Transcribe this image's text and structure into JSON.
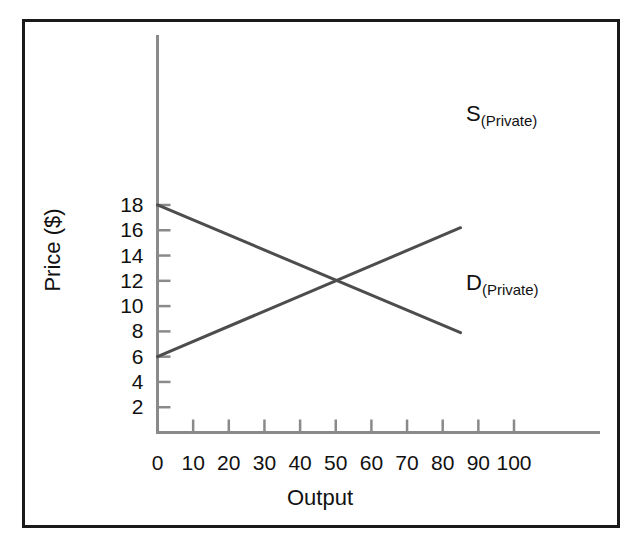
{
  "chart_data": {
    "type": "line",
    "title": "",
    "subtitle": "",
    "xlabel": "Output",
    "ylabel": "Price ($)",
    "xlim": [
      0,
      105
    ],
    "ylim": [
      0,
      19
    ],
    "grid": false,
    "legend_position": "inline-end-of-line",
    "x_ticks": [
      0,
      10,
      20,
      30,
      40,
      50,
      60,
      70,
      80,
      90,
      100
    ],
    "x_tick_labels": [
      "0",
      "10",
      "20",
      "30",
      "40",
      "50",
      "60",
      "70",
      "80",
      "90",
      "100"
    ],
    "y_ticks": [
      2,
      4,
      6,
      8,
      10,
      12,
      14,
      16,
      18
    ],
    "y_tick_labels": [
      "2",
      "4",
      "6",
      "8",
      "10",
      "12",
      "14",
      "16",
      "18"
    ],
    "series": [
      {
        "name": "S(Private)",
        "label_main": "S",
        "label_sub": "(Private)",
        "kind": "supply",
        "color": "#4d4d4d",
        "points": [
          [
            0,
            6
          ],
          [
            85,
            16.2
          ]
        ],
        "endpoints": {
          "start": {
            "x": 0,
            "y": 6
          },
          "end": {
            "x": 85,
            "y": 16.2
          }
        }
      },
      {
        "name": "D(Private)",
        "label_main": "D",
        "label_sub": "(Private)",
        "kind": "demand",
        "color": "#4d4d4d",
        "points": [
          [
            0,
            18
          ],
          [
            85,
            7.9
          ]
        ],
        "endpoints": {
          "start": {
            "x": 0,
            "y": 18
          },
          "end": {
            "x": 85,
            "y": 7.9
          }
        }
      }
    ],
    "annotations": [
      {
        "name": "equilibrium",
        "x": 50,
        "y": 12,
        "marked": false,
        "text": ""
      }
    ]
  },
  "axes": {
    "x_title": "Output",
    "y_title": "Price ($)",
    "axis_color": "#8a8a8a",
    "tick_color": "#8a8a8a"
  },
  "frame": {
    "border_color": "#1a1a1a"
  }
}
